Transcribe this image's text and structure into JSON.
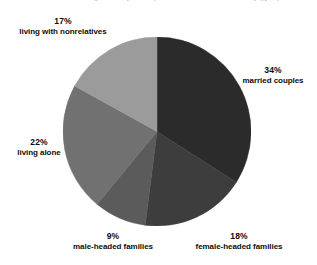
{
  "caption": {
    "text": "Figure 1. Proportion of households in the United States by type of household"
  },
  "chart_data": {
    "type": "pie",
    "title": "",
    "xlabel": "",
    "ylabel": "",
    "legend_position": "none",
    "grid": false,
    "units": "percent",
    "start_angle_deg": 0,
    "direction": "clockwise",
    "categories": [
      "married couples",
      "female-headed families",
      "male-headed families",
      "living alone",
      "living with nonrelatives"
    ],
    "values": [
      34,
      18,
      9,
      22,
      17
    ],
    "colors": [
      "#2b2b2b",
      "#3d3d3d",
      "#5b5b5b",
      "#717171",
      "#9b9b9b"
    ],
    "slices": [
      {
        "label": "married couples",
        "value": 34,
        "value_text": "34%",
        "color": "#2b2b2b",
        "label_position": "right"
      },
      {
        "label": "female-headed families",
        "value": 18,
        "value_text": "18%",
        "color": "#3d3d3d",
        "label_position": "bottom-right"
      },
      {
        "label": "male-headed families",
        "value": 9,
        "value_text": "9%",
        "color": "#5b5b5b",
        "label_position": "bottom-left"
      },
      {
        "label": "living alone",
        "value": 22,
        "value_text": "22%",
        "color": "#717171",
        "label_position": "left"
      },
      {
        "label": "living with nonrelatives",
        "value": 17,
        "value_text": "17%",
        "color": "#9b9b9b",
        "label_position": "top-left"
      }
    ]
  },
  "labels": {
    "married": {
      "pct": "34%",
      "name": "married couples"
    },
    "female": {
      "pct": "18%",
      "name": "female-headed families"
    },
    "male": {
      "pct": "9%",
      "name": "male-headed families"
    },
    "alone": {
      "pct": "22%",
      "name": "living alone"
    },
    "nonrelatives": {
      "pct": "17%",
      "name": "living with nonrelatives"
    }
  }
}
